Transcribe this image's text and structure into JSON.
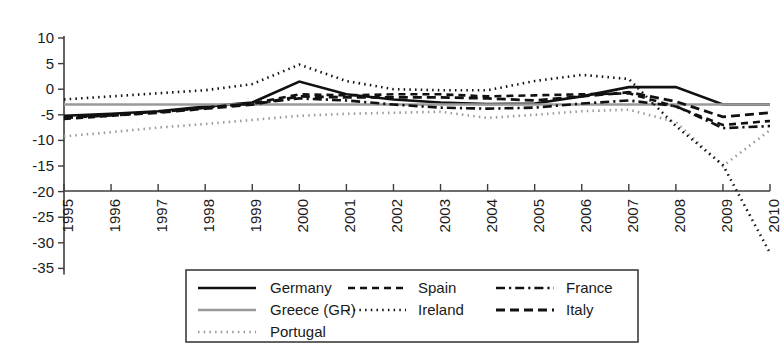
{
  "chart_data": {
    "type": "line",
    "title": "",
    "subtitle": "",
    "xlabel": "",
    "ylabel": "",
    "x": [
      1995,
      1996,
      1997,
      1998,
      1999,
      2000,
      2001,
      2002,
      2003,
      2004,
      2005,
      2006,
      2007,
      2008,
      2009,
      2010
    ],
    "xtick_labels": [
      "1995",
      "1996",
      "1997",
      "1998",
      "1999",
      "2000",
      "2001",
      "2002",
      "2003",
      "2004",
      "2005",
      "2006",
      "2007",
      "2008",
      "2009",
      "2010"
    ],
    "ytick_labels": [
      "10",
      "5",
      "0",
      "-5",
      "-10",
      "-15",
      "-20",
      "-25",
      "-30",
      "-35"
    ],
    "ytick_values": [
      10,
      5,
      0,
      -5,
      -10,
      -15,
      -20,
      -25,
      -30,
      -35
    ],
    "ylim": [
      -35,
      10
    ],
    "xlim": [
      1995,
      2010
    ],
    "grid": false,
    "legend_position": "bottom-center",
    "series": [
      {
        "name": "Germany",
        "style": "solid",
        "color": "#111111",
        "width": 2.6,
        "values": [
          -5.2,
          -4.8,
          -4.3,
          -3.4,
          -2.6,
          1.5,
          -1.0,
          -2.0,
          -2.6,
          -2.9,
          -2.8,
          -1.4,
          0.4,
          0.4,
          -3.0,
          -3.0
        ]
      },
      {
        "name": "Greece (GR)",
        "style": "solid",
        "color": "#9a9a9a",
        "width": 2.6,
        "values": [
          -3.0,
          -3.0,
          -3.0,
          -3.0,
          -3.0,
          -3.0,
          -3.0,
          -3.0,
          -3.0,
          -3.0,
          -3.0,
          -3.0,
          -3.0,
          -3.0,
          -3.0,
          -3.0
        ]
      },
      {
        "name": "Portugal",
        "style": "dotted",
        "color": "#9a9a9a",
        "width": 2.6,
        "values": [
          -9.2,
          -8.4,
          -7.5,
          -6.8,
          -6.0,
          -5.2,
          -4.8,
          -4.6,
          -4.4,
          -5.6,
          -5.0,
          -4.3,
          -4.0,
          -6.4,
          -15.0,
          -8.0
        ]
      },
      {
        "name": "Spain",
        "style": "dashed",
        "color": "#111111",
        "width": 2.6,
        "values": [
          -5.8,
          -5.2,
          -4.5,
          -3.6,
          -2.8,
          -1.0,
          -1.2,
          -1.0,
          -1.0,
          -1.4,
          -1.2,
          -1.0,
          -0.8,
          -3.4,
          -7.0,
          -6.2
        ]
      },
      {
        "name": "Ireland",
        "style": "dotted",
        "color": "#111111",
        "width": 2.6,
        "values": [
          -2.0,
          -1.4,
          -0.8,
          -0.2,
          1.0,
          4.8,
          1.6,
          0.0,
          -0.2,
          -0.2,
          1.6,
          2.8,
          2.0,
          -7.2,
          -14.8,
          -32.0
        ]
      },
      {
        "name": "France",
        "style": "dashdot",
        "color": "#111111",
        "width": 2.6,
        "values": [
          -5.5,
          -5.0,
          -4.4,
          -3.6,
          -2.8,
          -1.8,
          -2.2,
          -3.0,
          -3.6,
          -3.8,
          -3.6,
          -2.8,
          -2.2,
          -3.3,
          -7.6,
          -7.2
        ]
      },
      {
        "name": "Italy",
        "style": "dashed-long",
        "color": "#111111",
        "width": 2.8,
        "values": [
          -5.6,
          -5.1,
          -4.6,
          -3.8,
          -3.0,
          -1.4,
          -1.6,
          -1.6,
          -1.6,
          -1.8,
          -2.2,
          -1.4,
          -0.6,
          -2.4,
          -5.4,
          -4.6
        ]
      }
    ]
  },
  "legend": {
    "entries": [
      {
        "label": "Germany"
      },
      {
        "label": "Spain"
      },
      {
        "label": "France"
      },
      {
        "label": "Greece (GR)"
      },
      {
        "label": "Ireland"
      },
      {
        "label": "Italy"
      },
      {
        "label": "Portugal"
      }
    ]
  }
}
